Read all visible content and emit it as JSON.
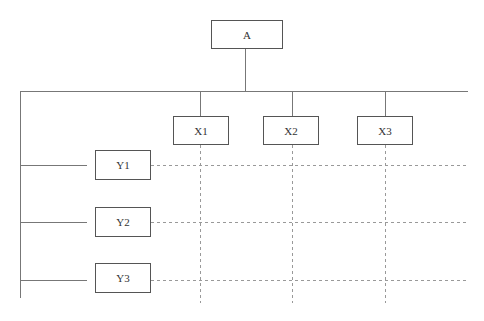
{
  "diagram": {
    "root": {
      "label": "A"
    },
    "columns": [
      {
        "label": "X1"
      },
      {
        "label": "X2"
      },
      {
        "label": "X3"
      }
    ],
    "rows": [
      {
        "label": "Y1"
      },
      {
        "label": "Y2"
      },
      {
        "label": "Y3"
      }
    ],
    "colors": {
      "line": "#777777",
      "dashed": "#999999",
      "box_border": "#555555"
    }
  }
}
